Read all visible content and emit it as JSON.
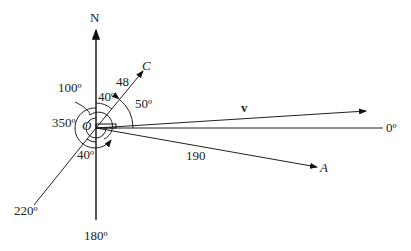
{
  "diagram": {
    "origin_label": "O",
    "north_label": "N",
    "bearings": {
      "east": "0º",
      "south": "180º",
      "southwest": "220º"
    },
    "vectors": {
      "v": {
        "label": "v"
      },
      "C": {
        "label": "C",
        "magnitude": "48"
      },
      "A": {
        "label": "A",
        "magnitude": "190"
      }
    },
    "angles": {
      "north_to_C": "40º",
      "C_to_east": "50º",
      "arc_100": "100º",
      "arc_350": "350º",
      "south_to_220": "40º"
    }
  }
}
